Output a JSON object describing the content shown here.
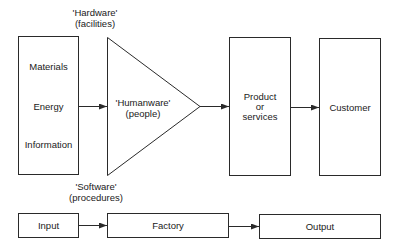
{
  "diagram": {
    "top_label": {
      "line1": "'Hardware'",
      "line2": "(facilities)"
    },
    "bottom_label": {
      "line1": "'Software'",
      "line2": "(procedures)"
    },
    "inputs_box": {
      "items": [
        "Materials",
        "Energy",
        "Information"
      ]
    },
    "humanware": {
      "line1": "'Humanware'",
      "line2": "(people)"
    },
    "product_box": {
      "line1": "Product",
      "line2": "or",
      "line3": "services"
    },
    "customer_box": {
      "label": "Customer"
    },
    "flow_row": {
      "input": "Input",
      "factory": "Factory",
      "output": "Output"
    }
  },
  "colors": {
    "stroke": "#2a2a2a",
    "background": "#ffffff",
    "text": "#1a1a1a"
  }
}
